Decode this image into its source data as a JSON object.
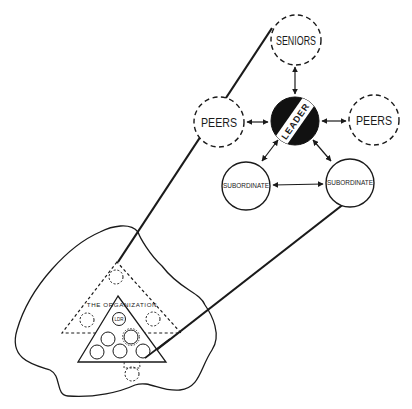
{
  "diagram": {
    "colors": {
      "ink": "#1a1a1a",
      "background": "#ffffff",
      "leader_fill": "#111111"
    },
    "nodes": {
      "seniors": {
        "label": "SENIORS",
        "style": "dashed"
      },
      "peers_left": {
        "label": "PEERS",
        "style": "dashed"
      },
      "peers_right": {
        "label": "PEERS",
        "style": "dashed"
      },
      "leader": {
        "label": "LEADER",
        "style": "filled-with-band"
      },
      "subordinate_left": {
        "label": "SUBORDINATE",
        "style": "solid"
      },
      "subordinate_right": {
        "label": "SUBORDINATE",
        "style": "solid"
      }
    },
    "edges": [
      {
        "from": "seniors",
        "to": "leader",
        "type": "bidirectional"
      },
      {
        "from": "peers_left",
        "to": "leader",
        "type": "bidirectional"
      },
      {
        "from": "leader",
        "to": "peers_right",
        "type": "bidirectional"
      },
      {
        "from": "leader",
        "to": "subordinate_left",
        "type": "bidirectional"
      },
      {
        "from": "leader",
        "to": "subordinate_right",
        "type": "bidirectional"
      },
      {
        "from": "subordinate_left",
        "to": "subordinate_right",
        "type": "bidirectional"
      }
    ],
    "organization": {
      "label": "THE ORGANIZATION",
      "leader_label": "LDR"
    }
  }
}
